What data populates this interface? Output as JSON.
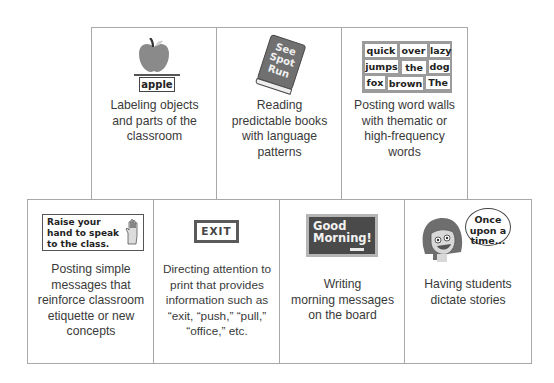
{
  "top_row": [
    {
      "id": "labeling",
      "caption_lines": [
        "Labeling objects",
        "and parts of the",
        "classroom"
      ],
      "illustration": {
        "type": "apple-icon",
        "label": "apple"
      }
    },
    {
      "id": "reading",
      "caption_lines": [
        "Reading",
        "predictable books",
        "with language",
        "patterns"
      ],
      "illustration": {
        "type": "book-icon",
        "title_lines": [
          "See",
          "Spot",
          "Run"
        ]
      }
    },
    {
      "id": "word-walls",
      "caption_lines": [
        "Posting word walls",
        "with thematic or",
        "high-frequency",
        "words"
      ],
      "illustration": {
        "type": "word-wall",
        "rows": [
          [
            "quick",
            "over",
            "lazy"
          ],
          [
            "jumps",
            "the",
            "dog"
          ],
          [
            "fox",
            "brown",
            "The"
          ]
        ]
      }
    }
  ],
  "bottom_row": [
    {
      "id": "simple-messages",
      "caption_lines": [
        "Posting simple",
        "messages that",
        "reinforce classroom",
        "etiquette or new",
        "concepts"
      ],
      "illustration": {
        "type": "sign-with-hand-icon",
        "text_lines": [
          "Raise your",
          "hand to speak",
          "to the class."
        ]
      }
    },
    {
      "id": "environmental-print",
      "caption_lines": [
        "Directing attention to",
        "print that provides",
        "information such as",
        "“exit, “push,” “pull,”",
        "“office,” etc."
      ],
      "illustration": {
        "type": "exit-sign",
        "text": "EXIT"
      }
    },
    {
      "id": "morning-messages",
      "caption_lines": [
        "Writing",
        "morning messages",
        "on the board"
      ],
      "illustration": {
        "type": "chalkboard",
        "text_lines": [
          "Good",
          "Morning!"
        ]
      }
    },
    {
      "id": "dictate-stories",
      "caption_lines": [
        "Having students",
        "dictate stories"
      ],
      "illustration": {
        "type": "girl-speech-bubble",
        "bubble_lines": [
          "Once",
          "upon a",
          "time..."
        ]
      }
    }
  ]
}
